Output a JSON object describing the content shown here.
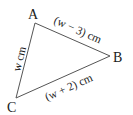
{
  "diagram": {
    "type": "triangle",
    "vertices": [
      {
        "label": "A",
        "x": 35,
        "y": 23
      },
      {
        "label": "B",
        "x": 110,
        "y": 56
      },
      {
        "label": "C",
        "x": 16,
        "y": 98
      }
    ],
    "sides": {
      "AB": "(w − 3) cm",
      "AC": "w cm",
      "CB": "(w + 2) cm"
    },
    "line_color": "#555555"
  }
}
